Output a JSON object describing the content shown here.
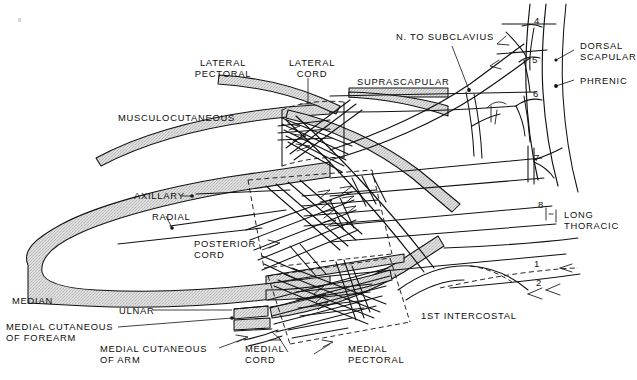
{
  "figure": {
    "background_color": "#ffffff",
    "line_color": "#111111",
    "band_fill_color": "#d9d9d9"
  },
  "labels": {
    "lateral_pectoral": "LATERAL\nPECTORAL",
    "lateral_cord": "LATERAL\nCORD",
    "musculocutaneous": "MUSCULOCUTANEOUS",
    "suprascapular": "SUPRASCAPULAR",
    "n_to_subclavius": "N. TO SUBCLAVIUS",
    "dorsal_scapular": "DORSAL\nSCAPULAR",
    "phrenic": "PHRENIC",
    "axillary": "AXILLARY",
    "radial": "RADIAL",
    "posterior_cord": "POSTERIOR\nCORD",
    "long_thoracic": "LONG\nTHORACIC",
    "median": "MEDIAN",
    "ulnar": "ULNAR",
    "medial_cutaneous_of_forearm": "MEDIAL CUTANEOUS\nOF FOREARM",
    "medial_cutaneous_of_arm": "MEDIAL CUTANEOUS\nOF ARM",
    "medial_cord": "MEDIAL\nCORD",
    "medial_pectoral": "MEDIAL\nPECTORAL",
    "first_intercostal": "1ST INTERCOSTAL"
  },
  "root_numbers": {
    "c4": "4",
    "c5": "5",
    "c6": "6",
    "c7": "7",
    "c8": "8",
    "t1": "1",
    "t2": "2"
  }
}
